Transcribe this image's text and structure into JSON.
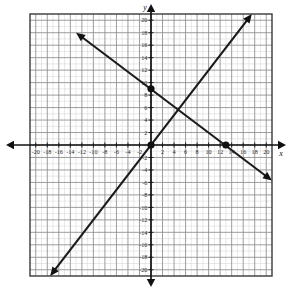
{
  "figure": {
    "kind": "coordinate-plane-graph",
    "x_axis_label": "x",
    "y_axis_label": "y"
  },
  "chart_data": {
    "type": "line",
    "title": "",
    "xlabel": "x",
    "ylabel": "y",
    "xlim": [
      -21,
      21
    ],
    "ylim": [
      -21,
      21
    ],
    "grid": true,
    "grid_major_step": 2,
    "grid_minor_step": 1,
    "legend": "none",
    "xticks": [
      -20,
      -18,
      -16,
      -14,
      -12,
      -10,
      -8,
      -6,
      -4,
      -2,
      2,
      4,
      6,
      8,
      10,
      12,
      14,
      16,
      18,
      20
    ],
    "yticks": [
      20,
      18,
      16,
      14,
      12,
      10,
      8,
      6,
      4,
      2,
      -2,
      -4,
      -6,
      -8,
      -10,
      -12,
      -14,
      -16,
      -18,
      -20
    ],
    "xtick_labels": [
      "-20",
      "-18",
      "-16",
      "-14",
      "-12",
      "-10",
      "-8",
      "-6",
      "-4",
      "-2",
      "2",
      "4",
      "6",
      "8",
      "10",
      "12",
      "14",
      "16",
      "18",
      "20"
    ],
    "ytick_labels": [
      "20",
      "18",
      "16",
      "14",
      "12",
      "10",
      "8",
      "6",
      "4",
      "2",
      "-2",
      "-4",
      "-6",
      "-8",
      "-10",
      "-12",
      "-14",
      "-16",
      "-18",
      "-20"
    ],
    "series": [
      {
        "name": "rising-line",
        "slope": 1.2,
        "intercept": 0,
        "x": [
          -17.5,
          17.5
        ],
        "y": [
          -21,
          21
        ],
        "arrows": "both",
        "color": "#1a1a1a"
      },
      {
        "name": "falling-line",
        "slope": -0.7,
        "intercept": 9,
        "x": [
          -13,
          21
        ],
        "y": [
          18,
          -5.7
        ],
        "arrows": "both",
        "color": "#1a1a1a"
      }
    ],
    "points": [
      {
        "label": "origin",
        "x": 0,
        "y": 0
      },
      {
        "label": "y-intercept",
        "x": 0,
        "y": 9
      },
      {
        "label": "x-intercept",
        "x": 13,
        "y": 0
      }
    ]
  },
  "colors": {
    "axis": "#111111",
    "line": "#1a1a1a",
    "grid_major": "#8d8d8d",
    "grid_minor": "#d3d3d3",
    "border": "#3a3a3a",
    "background": "#ffffff"
  }
}
